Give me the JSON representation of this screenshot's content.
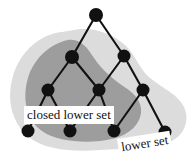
{
  "figure": {
    "width": 192,
    "height": 164,
    "background_color": "#ffffff"
  },
  "labels": {
    "closed_lower_set": "closed lower set",
    "lower_set": "lower set"
  },
  "colors": {
    "outer_region_fill": "#dcdcdc",
    "inner_region_fill": "#9d9d9d",
    "node_fill": "#111111",
    "edge_stroke": "#111111",
    "label_background": "#ffffff",
    "label_text": "#111111"
  },
  "diagram_data": {
    "type": "hasse-diagram",
    "nodes": [
      {
        "id": "t",
        "label": "",
        "x": 96,
        "y": 15,
        "r": 7.0,
        "level": 0
      },
      {
        "id": "a",
        "label": "",
        "x": 72,
        "y": 57,
        "r": 7.0,
        "level": 1
      },
      {
        "id": "b",
        "label": "",
        "x": 124,
        "y": 56,
        "r": 6.5,
        "level": 1
      },
      {
        "id": "c",
        "label": "",
        "x": 48,
        "y": 90,
        "r": 6.5,
        "level": 2
      },
      {
        "id": "d",
        "label": "",
        "x": 99,
        "y": 90,
        "r": 6.5,
        "level": 2
      },
      {
        "id": "e",
        "label": "",
        "x": 143,
        "y": 90,
        "r": 6.5,
        "level": 2
      },
      {
        "id": "f",
        "label": "",
        "x": 28,
        "y": 131,
        "r": 6.5,
        "level": 3
      },
      {
        "id": "g",
        "label": "",
        "x": 70,
        "y": 131,
        "r": 6.5,
        "level": 3
      },
      {
        "id": "h",
        "label": "",
        "x": 114,
        "y": 131,
        "r": 6.5,
        "level": 3
      },
      {
        "id": "i",
        "label": "",
        "x": 165,
        "y": 132,
        "r": 6.5,
        "level": 3
      }
    ],
    "edges": [
      {
        "from": "t",
        "to": "a"
      },
      {
        "from": "t",
        "to": "b"
      },
      {
        "from": "a",
        "to": "c"
      },
      {
        "from": "a",
        "to": "d"
      },
      {
        "from": "b",
        "to": "d"
      },
      {
        "from": "b",
        "to": "e"
      },
      {
        "from": "c",
        "to": "f"
      },
      {
        "from": "c",
        "to": "g"
      },
      {
        "from": "d",
        "to": "g"
      },
      {
        "from": "d",
        "to": "h"
      },
      {
        "from": "e",
        "to": "h"
      },
      {
        "from": "e",
        "to": "i"
      }
    ],
    "regions": [
      {
        "id": "lower-set",
        "label": "lower set",
        "fill": "#dcdcdc",
        "members": [
          "a",
          "b",
          "c",
          "d",
          "e",
          "f",
          "g",
          "h",
          "i"
        ]
      },
      {
        "id": "closed-lower-set",
        "label": "closed lower set",
        "fill": "#9d9d9d",
        "members": [
          "a",
          "c",
          "d",
          "f",
          "g",
          "h"
        ]
      }
    ]
  }
}
